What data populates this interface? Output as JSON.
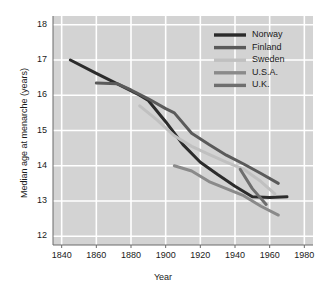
{
  "chart_data": {
    "type": "line",
    "title": "",
    "xlabel": "Year",
    "ylabel": "Median age at menarche (years)",
    "xlim": [
      1835,
      1985
    ],
    "ylim": [
      11.75,
      18.25
    ],
    "xticks": [
      1840,
      1860,
      1880,
      1900,
      1920,
      1940,
      1960,
      1980
    ],
    "yticks": [
      12,
      13,
      14,
      15,
      16,
      17,
      18
    ],
    "xtick_labels": [
      "1840",
      "1860",
      "1880",
      "1900",
      "1920",
      "1940",
      "1960",
      "1980"
    ],
    "ytick_labels": [
      "12",
      "13",
      "14",
      "15",
      "16",
      "17",
      "18"
    ],
    "grid": true,
    "grid_color": "#ffffff",
    "plot_background": "#d3d3d3",
    "figure_background": "#ffffff",
    "legend_position": "top-right",
    "series": [
      {
        "name": "Norway",
        "color": "#2b2b2b",
        "width": 3.0,
        "x": [
          1845,
          1860,
          1875,
          1885,
          1890,
          1900,
          1910,
          1920,
          1930,
          1940,
          1950,
          1960,
          1970
        ],
        "y": [
          17.0,
          16.62,
          16.25,
          16.0,
          15.85,
          15.25,
          14.6,
          14.1,
          13.75,
          13.42,
          13.12,
          13.1,
          13.12
        ]
      },
      {
        "name": "Finland",
        "color": "#5a5a5a",
        "width": 3.0,
        "x": [
          1860,
          1872,
          1880,
          1890,
          1900,
          1905,
          1915,
          1925,
          1935,
          1945,
          1955,
          1965
        ],
        "y": [
          16.35,
          16.33,
          16.15,
          15.9,
          15.62,
          15.5,
          14.92,
          14.6,
          14.3,
          14.05,
          13.78,
          13.5
        ]
      },
      {
        "name": "Sweden",
        "color": "#c0c0c0",
        "width": 3.0,
        "x": [
          1885,
          1895,
          1905,
          1915,
          1925,
          1935,
          1945,
          1955,
          1963
        ],
        "y": [
          15.7,
          15.3,
          14.85,
          14.55,
          14.32,
          14.1,
          13.9,
          13.55,
          13.2
        ]
      },
      {
        "name": "U.S.A.",
        "color": "#8a8a8a",
        "width": 3.0,
        "x": [
          1905,
          1915,
          1925,
          1935,
          1945,
          1955,
          1965
        ],
        "y": [
          14.0,
          13.85,
          13.55,
          13.35,
          13.15,
          12.85,
          12.6
        ]
      },
      {
        "name": "U.K.",
        "color": "#6e6e6e",
        "width": 3.0,
        "x": [
          1943,
          1950,
          1958
        ],
        "y": [
          13.9,
          13.35,
          12.9
        ]
      }
    ]
  },
  "legend": {
    "entries": [
      {
        "label": "Norway",
        "color": "#2b2b2b"
      },
      {
        "label": "Finland",
        "color": "#5a5a5a"
      },
      {
        "label": "Sweden",
        "color": "#c0c0c0"
      },
      {
        "label": "U.S.A.",
        "color": "#8a8a8a"
      },
      {
        "label": "U.K.",
        "color": "#6e6e6e"
      }
    ]
  }
}
